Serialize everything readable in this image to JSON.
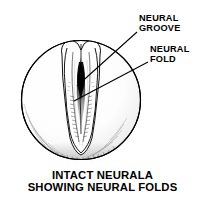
{
  "figure": {
    "type": "biological-line-drawing",
    "background_color": "#ffffff",
    "ink_color": "#000000",
    "circle": {
      "cx": 81,
      "cy": 100,
      "r": 60
    },
    "callouts": [
      {
        "id": "neural-groove",
        "line1": "NEURAL",
        "line2": "GROOVE",
        "leader_from": {
          "x": 137,
          "y": 32
        },
        "leader_to": {
          "x": 77,
          "y": 86
        }
      },
      {
        "id": "neural-fold",
        "line1": "NEURAL",
        "line2": "FOLD",
        "leader_from": {
          "x": 148,
          "y": 62
        },
        "leader_to": {
          "x": 74,
          "y": 101
        }
      }
    ]
  },
  "caption": {
    "line1": "INTACT NEURALA",
    "line2": "SHOWING NEURAL FOLDS"
  }
}
